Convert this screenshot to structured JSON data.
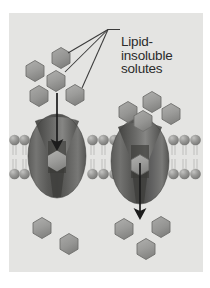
{
  "figure": {
    "domain_subject": "cell-membrane-transport",
    "panel_background": "#e4e4e2",
    "page_background": "#ffffff"
  },
  "labels": {
    "solute_label": {
      "name": "lipid-insoluble-solutes-label",
      "lines": [
        "Lipid-",
        "insoluble",
        "solutes"
      ],
      "color": "#2b2b2b"
    }
  },
  "colors": {
    "background": "#e4e4e2",
    "solute_fill": "#9a9a98",
    "solute_fill_light": "#a8a8a6",
    "solute_stroke": "#6f6f6d",
    "protein_dark": "#4a4a48",
    "protein_mid": "#6a6a68",
    "protein_light": "#8e8e8c",
    "lipid_head": "#8d8d8b",
    "lipid_head_highlight": "#b6b6b4",
    "lipid_tail": "#c9c9c7",
    "arrow": "#1c1c1c",
    "leader_line": "#3a3a3a",
    "text": "#2b2b2b"
  },
  "membrane": {
    "name": "phospholipid-bilayer",
    "upper_head_center_y": 127,
    "lower_head_center_y": 160,
    "head_radius": 5.2,
    "head_spacing": 10.4,
    "tail_color": "#c9c9c7",
    "left_span_x": [
      0,
      44
    ],
    "middle_span_x": [
      78,
      124
    ],
    "right_span_x": [
      158,
      194
    ]
  },
  "proteins": [
    {
      "name": "transport-protein-left",
      "center_x": 48,
      "center_y": 143,
      "radius_x": 29,
      "radius_y": 42,
      "channel_solute": true
    },
    {
      "name": "transport-protein-right",
      "center_x": 131,
      "center_y": 148,
      "radius_x": 29,
      "radius_y": 43,
      "channel_solute": true
    }
  ],
  "arrows": [
    {
      "name": "transport-arrow-left",
      "x": 48,
      "y_start": 80,
      "y_end": 133,
      "direction": "down"
    },
    {
      "name": "transport-arrow-right",
      "x": 131,
      "y_start": 150,
      "y_end": 202,
      "direction": "down"
    }
  ],
  "solutes": {
    "name": "lipid-insoluble-solute",
    "shape": "hexagon",
    "extracellular_upper_left": [
      {
        "cx": 26,
        "cy": 58,
        "r": 10.5
      },
      {
        "cx": 52,
        "cy": 45,
        "r": 10.5
      },
      {
        "cx": 47,
        "cy": 68,
        "r": 10.5
      },
      {
        "cx": 30,
        "cy": 83,
        "r": 10.5
      },
      {
        "cx": 66,
        "cy": 82,
        "r": 10.5
      }
    ],
    "extracellular_upper_right": [
      {
        "cx": 119,
        "cy": 99,
        "r": 10.5
      },
      {
        "cx": 143,
        "cy": 89,
        "r": 10.5
      },
      {
        "cx": 134,
        "cy": 108,
        "r": 10.5
      },
      {
        "cx": 162,
        "cy": 101,
        "r": 10.5
      }
    ],
    "intracellular": [
      {
        "cx": 33,
        "cy": 215,
        "r": 10.5
      },
      {
        "cx": 60,
        "cy": 231,
        "r": 10.5
      },
      {
        "cx": 115,
        "cy": 216,
        "r": 10.5
      },
      {
        "cx": 152,
        "cy": 214,
        "r": 10.5
      },
      {
        "cx": 137,
        "cy": 236,
        "r": 10.5
      }
    ],
    "in_channel": [
      {
        "cx": 48,
        "cy": 148,
        "r": 10.5
      },
      {
        "cx": 131,
        "cy": 152,
        "r": 10.5
      }
    ]
  },
  "leader_lines": {
    "name": "label-leader-lines",
    "junction": {
      "x": 99,
      "y": 29
    },
    "horizontal_end": {
      "x": 111,
      "y": 29
    },
    "targets": [
      {
        "x": 59,
        "y": 53
      },
      {
        "x": 56,
        "y": 72
      },
      {
        "x": 73,
        "y": 88
      }
    ]
  }
}
